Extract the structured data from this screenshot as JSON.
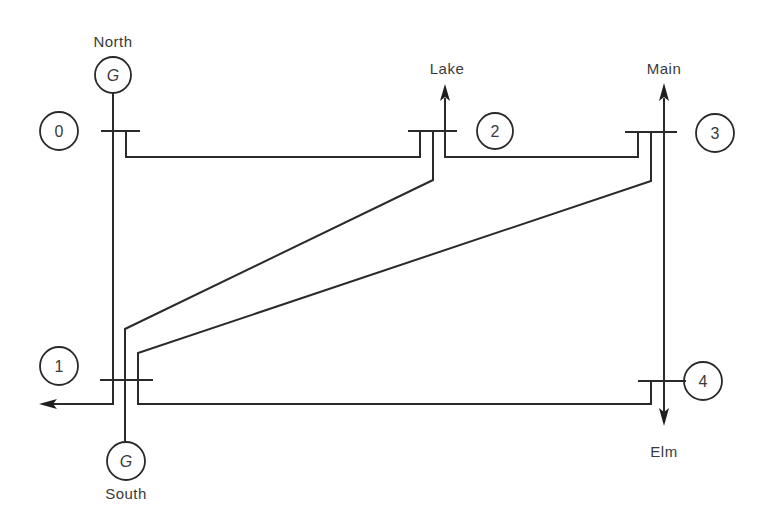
{
  "diagram": {
    "colors": {
      "line": "#2a2a2a",
      "text": "#3a3a3a",
      "background": "#ffffff"
    },
    "buses": [
      {
        "id": "0",
        "label": "0"
      },
      {
        "id": "1",
        "label": "1"
      },
      {
        "id": "2",
        "label": "2"
      },
      {
        "id": "3",
        "label": "3"
      },
      {
        "id": "4",
        "label": "4"
      }
    ],
    "generators": [
      {
        "bus": "0",
        "symbol": "G",
        "name": "North"
      },
      {
        "bus": "1",
        "symbol": "G",
        "name": "South"
      }
    ],
    "loads": [
      {
        "bus": "1",
        "name": "",
        "direction": "left"
      },
      {
        "bus": "2",
        "name": "Lake",
        "direction": "up"
      },
      {
        "bus": "3",
        "name": "Main",
        "direction": "up"
      },
      {
        "bus": "4",
        "name": "Elm",
        "direction": "down"
      }
    ],
    "lines": [
      {
        "from": "0",
        "to": "1"
      },
      {
        "from": "0",
        "to": "2"
      },
      {
        "from": "1",
        "to": "2"
      },
      {
        "from": "1",
        "to": "3"
      },
      {
        "from": "1",
        "to": "4"
      },
      {
        "from": "2",
        "to": "3"
      },
      {
        "from": "3",
        "to": "4"
      }
    ]
  }
}
